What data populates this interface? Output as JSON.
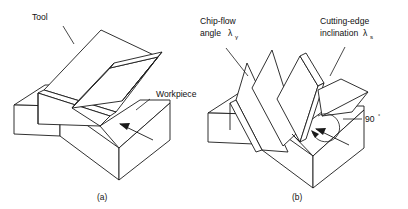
{
  "figure": {
    "background_color": "#ffffff",
    "line_color": "#1a1a1a",
    "panels": [
      {
        "id": "panel-a",
        "caption": "(a)",
        "description": "Orthogonal cutting setup: wedge-shaped tool on a rectangular workpiece block with chip",
        "labels": [
          {
            "name": "tool",
            "text": "Tool"
          },
          {
            "name": "workpiece",
            "text": "Workpiece"
          }
        ]
      },
      {
        "id": "panel-b",
        "caption": "(b)",
        "description": "Oblique cutting setup showing chip-flow angle and cutting-edge inclination",
        "labels": [
          {
            "name": "chip-flow-angle",
            "line1": "Chip-flow",
            "line2": "angle",
            "symbol": "λ",
            "subscript": "γ"
          },
          {
            "name": "cutting-edge-inclination",
            "line1": "Cutting-edge",
            "line2": "inclination",
            "symbol": "λ",
            "subscript": "s"
          },
          {
            "name": "right-angle",
            "value": "90",
            "unit": "°"
          }
        ]
      }
    ]
  }
}
